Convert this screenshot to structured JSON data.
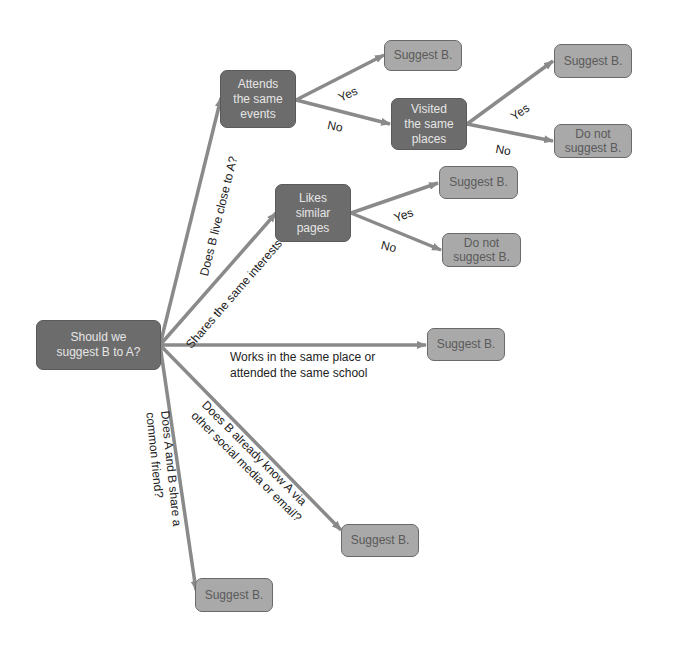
{
  "colors": {
    "decision_fill": "#6c6c6c",
    "leaf_fill": "#a9a9a9",
    "edge": "#8a8a8a",
    "text_dark": "#222222"
  },
  "nodes": {
    "root": "Should we\nsuggest B to A?",
    "attends": "Attends\nthe same\nevents",
    "visited": "Visited\nthe same\nplaces",
    "likes": "Likes\nsimilar\npages",
    "suggest_attends_yes": "Suggest B.",
    "suggest_visited_yes": "Suggest B.",
    "donot_visited_no": "Do not\nsuggest B.",
    "suggest_likes_yes": "Suggest B.",
    "donot_likes_no": "Do not\nsuggest B.",
    "suggest_works": "Suggest B.",
    "suggest_email": "Suggest B.",
    "suggest_friend": "Suggest B."
  },
  "edge_labels": {
    "lives_close": "Does B live close to A?",
    "same_interests": "Shares the same interests",
    "works_school": "Works in the same place or\nattended the same school",
    "knows_via": "Does B already know A via\nother social media or email?",
    "common_friend": "Does A and B share a\ncommon friend?",
    "attends_yes": "Yes",
    "attends_no": "No",
    "visited_yes": "Yes",
    "visited_no": "No",
    "likes_yes": "Yes",
    "likes_no": "No"
  }
}
